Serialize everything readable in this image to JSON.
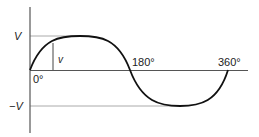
{
  "diagram": {
    "labels": {
      "peak_positive": "V",
      "peak_negative": "−V",
      "instantaneous": "v",
      "origin_angle": "0°",
      "half_cycle_angle": "180°",
      "full_cycle_angle": "360°"
    },
    "colors": {
      "curve": "#111111",
      "axis": "#555555",
      "reference_line": "#aaaaaa"
    }
  }
}
